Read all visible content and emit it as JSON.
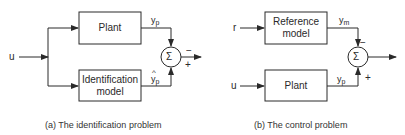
{
  "panels": [
    {
      "id": "a",
      "caption": "(a)  The identification problem",
      "input_label": "u",
      "top_block": "Plant",
      "bottom_block_line1": "Identification",
      "bottom_block_line2": "model",
      "top_signal": "y",
      "top_signal_sub": "p",
      "bottom_signal": "y",
      "bottom_signal_sub": "p",
      "bottom_signal_hat": true,
      "sum_symbol": "Σ",
      "top_sign": "−",
      "bottom_sign": "+"
    },
    {
      "id": "b",
      "caption": "(b)  The control problem",
      "top_input_label": "r",
      "bottom_input_label": "u",
      "top_block_line1": "Reference",
      "top_block_line2": "model",
      "bottom_block": "Plant",
      "top_signal": "y",
      "top_signal_sub": "m",
      "bottom_signal": "y",
      "bottom_signal_sub": "p",
      "sum_symbol": "Σ",
      "top_sign": "−",
      "bottom_sign": "+"
    }
  ],
  "colors": {
    "line": "#2a2a2a",
    "background": "#ffffff"
  }
}
